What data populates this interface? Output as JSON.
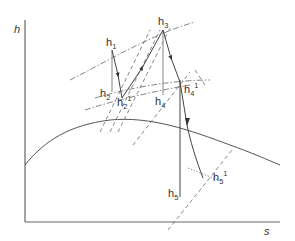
{
  "diagram": {
    "type": "h-s (Mollier) diagram, reheat steam cycle with real expansions",
    "axes": {
      "y_label": "h",
      "x_label": "s"
    },
    "points": [
      {
        "id": "h1",
        "base": "h",
        "sub": "1",
        "sup": ""
      },
      {
        "id": "h2",
        "base": "h",
        "sub": "2",
        "sup": ""
      },
      {
        "id": "h2p",
        "base": "h",
        "sub": "2",
        "sup": "1"
      },
      {
        "id": "h3",
        "base": "h",
        "sub": "3",
        "sup": ""
      },
      {
        "id": "h4",
        "base": "h",
        "sub": "4",
        "sup": ""
      },
      {
        "id": "h4p",
        "base": "h",
        "sub": "4",
        "sup": "1"
      },
      {
        "id": "h5",
        "base": "h",
        "sub": "5",
        "sup": ""
      },
      {
        "id": "h5p",
        "base": "h",
        "sub": "5",
        "sup": "1"
      }
    ],
    "colors": {
      "lines": "#444444",
      "ideal_lines": "#999999",
      "axis": "#666666",
      "text": "#333333"
    }
  }
}
